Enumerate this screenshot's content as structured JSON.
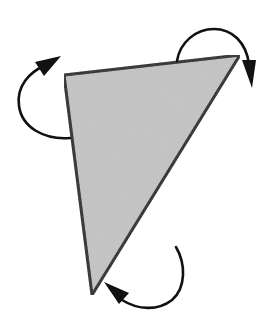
{
  "diagram": {
    "title": "",
    "shape": {
      "type": "triangle",
      "fill_color": "#c4c4c4",
      "stroke_color": "#111111"
    },
    "arrows": [
      {
        "name": "top-left-rotation-arrow",
        "direction": "counter-clockwise",
        "color": "#111111"
      },
      {
        "name": "top-right-rotation-arrow",
        "direction": "clockwise",
        "color": "#111111"
      },
      {
        "name": "bottom-rotation-arrow",
        "direction": "clockwise",
        "color": "#111111"
      }
    ],
    "colors": {
      "background": "#ffffff",
      "shape_fill": "#c4c4c4",
      "ink": "#111111"
    }
  }
}
